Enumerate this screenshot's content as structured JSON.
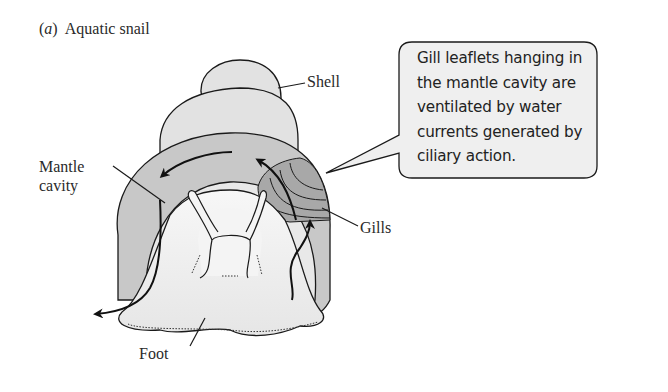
{
  "figure": {
    "panel_letter": "a",
    "title": "Aquatic snail"
  },
  "labels": {
    "shell": "Shell",
    "mantle_cavity_line1": "Mantle",
    "mantle_cavity_line2": "cavity",
    "gills": "Gills",
    "foot": "Foot"
  },
  "callout": {
    "text_lines": [
      "Gill leaflets hanging in",
      "the mantle cavity are",
      "ventilated by water",
      "currents generated by",
      "ciliary action."
    ]
  },
  "colors": {
    "shell_fill": "#e4e4e4",
    "mantle_band_fill": "#bdbdbd",
    "gill_fill_dark": "#9a9a9a",
    "gill_fill_light": "#b8b8b8",
    "body_fill": "#f1f1f1",
    "callout_fill": "#f0f0f0",
    "stroke": "#1a1a1a"
  }
}
